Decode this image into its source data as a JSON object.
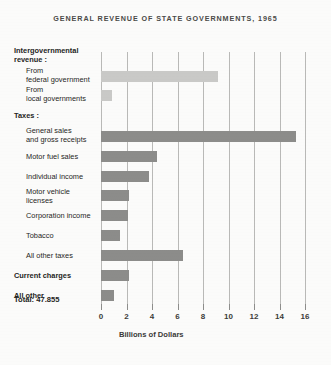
{
  "chart_data": {
    "type": "bar",
    "orientation": "horizontal",
    "title": "GENERAL REVENUE OF STATE GOVERNMENTS, 1965",
    "xlabel": "Billions of Dollars",
    "ylabel": "",
    "xlim": [
      0,
      16
    ],
    "xticks": [
      0,
      2,
      4,
      6,
      8,
      10,
      12,
      14,
      16
    ],
    "xtick_labels": [
      "0",
      "2",
      "4",
      "6",
      "8",
      "10",
      "12",
      "14",
      "16"
    ],
    "grid": true,
    "legend": false,
    "total_label": "Total:  47.855",
    "total_value": 47.855,
    "group_headings": [
      "Intergovernmental revenue:",
      "Taxes:"
    ],
    "categories": [
      "From federal government",
      "From local governments",
      "General sales and gross receipts",
      "Motor fuel sales",
      "Individual income",
      "Motor vehicle licenses",
      "Corporation income",
      "Tobacco",
      "All other taxes",
      "Current charges",
      "All other"
    ],
    "values": [
      9.2,
      0.9,
      15.3,
      4.4,
      3.8,
      2.2,
      2.1,
      1.5,
      6.4,
      2.2,
      1.0
    ],
    "colors": {
      "intergovernmental": "#c9c9c7",
      "taxes": "#8c8c8a",
      "background": "#fbfbfa",
      "gridline": "#b9b9b7",
      "text": "#262624",
      "title_text": "#4a4a48"
    }
  },
  "rows": [
    {
      "kind": "heading",
      "lines": [
        "Intergovernmental",
        "revenue :"
      ],
      "top": 46,
      "left": 14
    },
    {
      "kind": "bar",
      "lines": [
        "From",
        "federal government"
      ],
      "label_top": 66,
      "left": 26,
      "value": 9.2,
      "bar_top": 71,
      "bar_height": 11,
      "style": "light"
    },
    {
      "kind": "bar",
      "lines": [
        "From",
        "local governments"
      ],
      "label_top": 85,
      "left": 26,
      "value": 0.9,
      "bar_top": 90,
      "bar_height": 11,
      "style": "light"
    },
    {
      "kind": "heading",
      "lines": [
        "Taxes :"
      ],
      "top": 111,
      "left": 14
    },
    {
      "kind": "bar",
      "lines": [
        "General sales",
        "and gross receipts"
      ],
      "label_top": 126,
      "left": 26,
      "value": 15.3,
      "bar_top": 131,
      "bar_height": 11,
      "style": "dark"
    },
    {
      "kind": "bar",
      "lines": [
        "Motor fuel sales"
      ],
      "label_top": 152,
      "left": 26,
      "value": 4.4,
      "bar_top": 151,
      "bar_height": 11,
      "style": "dark"
    },
    {
      "kind": "bar",
      "lines": [
        "Individual income"
      ],
      "label_top": 172,
      "left": 26,
      "value": 3.8,
      "bar_top": 171,
      "bar_height": 11,
      "style": "dark"
    },
    {
      "kind": "bar",
      "lines": [
        "Motor vehicle",
        "licenses"
      ],
      "label_top": 187,
      "left": 26,
      "value": 2.2,
      "bar_top": 190,
      "bar_height": 11,
      "style": "dark"
    },
    {
      "kind": "bar",
      "lines": [
        "Corporation income"
      ],
      "label_top": 211,
      "left": 26,
      "value": 2.1,
      "bar_top": 210,
      "bar_height": 11,
      "style": "dark"
    },
    {
      "kind": "bar",
      "lines": [
        "Tobacco"
      ],
      "label_top": 231,
      "left": 26,
      "value": 1.5,
      "bar_top": 230,
      "bar_height": 11,
      "style": "dark"
    },
    {
      "kind": "bar",
      "lines": [
        "All other taxes"
      ],
      "label_top": 251,
      "left": 26,
      "value": 6.4,
      "bar_top": 250,
      "bar_height": 11,
      "style": "dark"
    },
    {
      "kind": "bar",
      "lines": [
        "Current charges"
      ],
      "label_top": 271,
      "left": 14,
      "bold": true,
      "value": 2.2,
      "bar_top": 270,
      "bar_height": 11,
      "style": "dark"
    },
    {
      "kind": "bar",
      "lines": [
        "All other"
      ],
      "label_top": 291,
      "left": 14,
      "bold": true,
      "value": 1.0,
      "bar_top": 290,
      "bar_height": 11,
      "style": "dark"
    }
  ]
}
